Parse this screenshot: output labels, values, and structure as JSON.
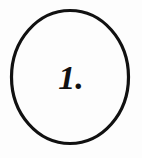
{
  "figure": {
    "type": "numbered-circle-marker",
    "label": "1.",
    "numeral": "1",
    "punctuation": ".",
    "shape": "circle",
    "shape_icon_name": "circle-outline-icon",
    "colors": {
      "background": "#fdfdfd",
      "stroke": "#111111",
      "text": "#111111",
      "fill": "#fdfdfd"
    },
    "geometry": {
      "center_x": 70,
      "center_y": 77,
      "radius_x": 60,
      "radius_y": 68,
      "stroke_width": 3,
      "label_x": 71,
      "label_baseline_y": 89
    },
    "canvas": {
      "width": 142,
      "height": 158
    }
  }
}
